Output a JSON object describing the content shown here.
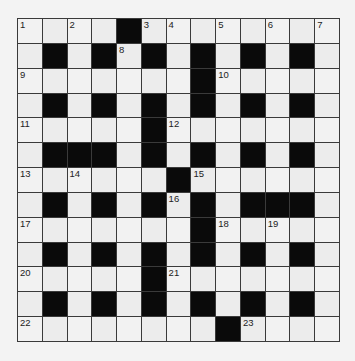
{
  "puzzle": {
    "type": "crossword",
    "rows": 13,
    "cols": 13,
    "colors": {
      "background": "#f3f3f3",
      "cell": "#f2f2f2",
      "block": "#0a0a0a",
      "border": "#3a3a3a"
    },
    "grid": [
      "....#........",
      ".#.#.#.#.#.#.",
      ".......#.....",
      ".#.#.#.#.#.#.",
      ".....#.......",
      ".###.#.#.#.#.",
      "......#......",
      ".#.#.#.#.###.",
      ".......#.....",
      ".#.#.#.#.#.#.",
      ".....#.......",
      ".#.#.#.#.#.#.",
      "........#...."
    ],
    "numbers": [
      {
        "r": 0,
        "c": 0,
        "n": "1"
      },
      {
        "r": 0,
        "c": 2,
        "n": "2"
      },
      {
        "r": 0,
        "c": 5,
        "n": "3"
      },
      {
        "r": 0,
        "c": 6,
        "n": "4"
      },
      {
        "r": 0,
        "c": 8,
        "n": "5"
      },
      {
        "r": 0,
        "c": 10,
        "n": "6"
      },
      {
        "r": 0,
        "c": 12,
        "n": "7"
      },
      {
        "r": 1,
        "c": 4,
        "n": "8"
      },
      {
        "r": 2,
        "c": 0,
        "n": "9"
      },
      {
        "r": 2,
        "c": 8,
        "n": "10"
      },
      {
        "r": 4,
        "c": 0,
        "n": "11"
      },
      {
        "r": 4,
        "c": 6,
        "n": "12"
      },
      {
        "r": 6,
        "c": 0,
        "n": "13"
      },
      {
        "r": 6,
        "c": 2,
        "n": "14"
      },
      {
        "r": 6,
        "c": 7,
        "n": "15"
      },
      {
        "r": 7,
        "c": 6,
        "n": "16"
      },
      {
        "r": 8,
        "c": 0,
        "n": "17"
      },
      {
        "r": 8,
        "c": 8,
        "n": "18"
      },
      {
        "r": 8,
        "c": 10,
        "n": "19"
      },
      {
        "r": 10,
        "c": 0,
        "n": "20"
      },
      {
        "r": 10,
        "c": 6,
        "n": "21"
      },
      {
        "r": 12,
        "c": 0,
        "n": "22"
      },
      {
        "r": 12,
        "c": 9,
        "n": "23"
      }
    ]
  }
}
